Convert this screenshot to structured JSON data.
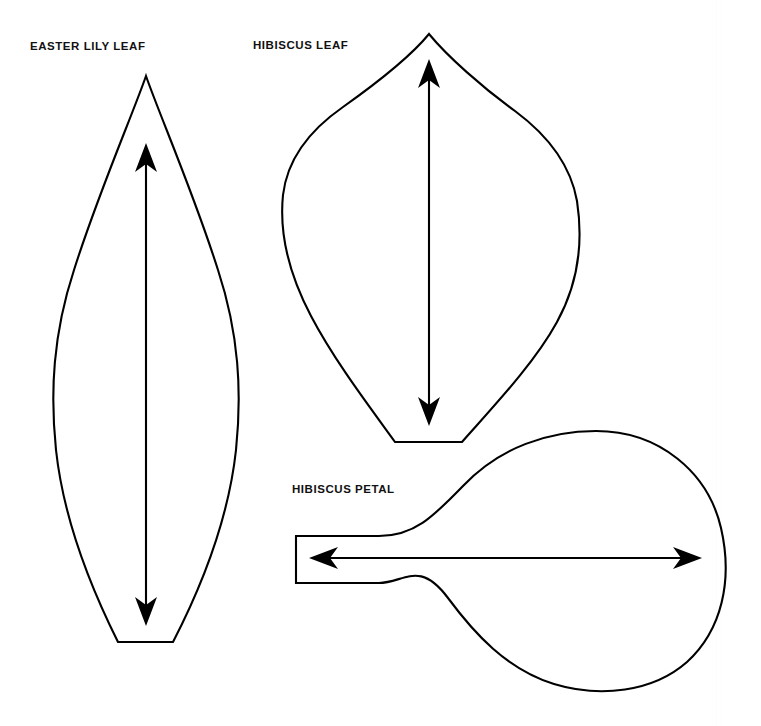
{
  "document": {
    "title": "Flower Template Sheet",
    "background_color": "#ffffff",
    "ink_color": "#000000",
    "width": 761,
    "height": 726
  },
  "labels": {
    "easter_lily_leaf": "EASTER LILY LEAF",
    "hibiscus_leaf": "HIBISCUS LEAF",
    "hibiscus_petal": "HIBISCUS PETAL"
  },
  "templates": [
    {
      "id": "easter-lily-leaf",
      "label": "EASTER LILY LEAF",
      "shape": "lanceolate leaf with pointed tip and flat cut base",
      "outline_path": "M 146 76 C 131 118 96 196 72 272 C 52 336 50 392 56 448 C 63 512 86 576 118 641 L 173 641 C 206 576 229 512 236 448 C 242 392 240 336 220 272 C 196 196 161 118 146 76 Z",
      "grain_arrow": {
        "name": "grain-direction-arrow",
        "direction": "vertical-double",
        "x": 146,
        "y_top": 144,
        "y_bottom": 625
      }
    },
    {
      "id": "hibiscus-leaf",
      "label": "HIBISCUS LEAF",
      "shape": "broad heart-cordate leaf with pointed apex and flat cut base",
      "outline_path": "M 429 34 C 410 56 372 86 341 108 C 306 133 288 162 283 194 C 278 232 288 274 309 314 C 333 360 368 404 395 442 L 462 442 C 492 408 533 366 557 322 C 578 282 583 240 577 200 C 571 166 551 137 516 111 C 484 88 447 56 429 34 Z",
      "grain_arrow": {
        "name": "grain-direction-arrow",
        "direction": "vertical-double",
        "x": 429,
        "y_top": 60,
        "y_bottom": 425
      }
    },
    {
      "id": "hibiscus-petal",
      "label": "HIBISCUS PETAL",
      "shape": "rounded fan petal with narrow rectangular stem on the left",
      "outline_path": "M 296 536 L 380 536 C 416 536 436 515 466 484 C 504 444 556 430 600 431 C 660 432 706 470 719 523 C 731 572 725 620 696 654 C 664 692 610 702 563 689 C 512 675 480 641 452 607 C 420 568 404 583 380 583 L 296 583 Z",
      "grain_arrow": {
        "name": "grain-direction-arrow",
        "direction": "horizontal-double",
        "y": 558,
        "x_left": 310,
        "x_right": 700
      }
    }
  ]
}
